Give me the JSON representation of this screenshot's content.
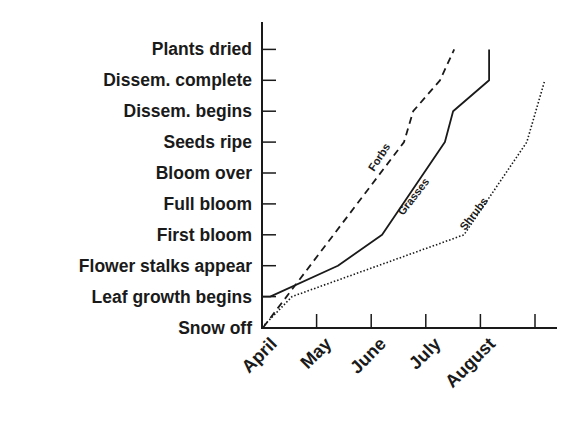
{
  "chart_data": {
    "type": "line",
    "title": "",
    "xlabel": "",
    "ylabel": "",
    "x_categories": [
      "April",
      "May",
      "June",
      "July",
      "August"
    ],
    "y_categories": [
      "Snow off",
      "Leaf growth begins",
      "Flower stalks appear",
      "First bloom",
      "Full bloom",
      "Bloom over",
      "Seeds ripe",
      "Dissem. begins",
      "Dissem. complete",
      "Plants dried"
    ],
    "x_unit": "months after April 1",
    "xlim": [
      0,
      5.4
    ],
    "ylim": [
      0,
      9
    ],
    "grid": false,
    "legend": "inline labels on lines",
    "series": [
      {
        "name": "Forbs",
        "style": "dashed",
        "points": [
          [
            0.02,
            0
          ],
          [
            2.6,
            6
          ],
          [
            2.77,
            7
          ],
          [
            3.26,
            8
          ],
          [
            3.52,
            9
          ]
        ]
      },
      {
        "name": "Grasses",
        "style": "solid",
        "points": [
          [
            0,
            0
          ],
          [
            0.0,
            1
          ],
          [
            0.15,
            1
          ],
          [
            1.39,
            2
          ],
          [
            2.2,
            3
          ],
          [
            3.35,
            6
          ],
          [
            3.5,
            7
          ],
          [
            4.16,
            8
          ],
          [
            4.16,
            9
          ]
        ]
      },
      {
        "name": "Shrubs",
        "style": "dotted",
        "points": [
          [
            0,
            0
          ],
          [
            0.55,
            1
          ],
          [
            3.7,
            3
          ],
          [
            4.85,
            6
          ],
          [
            5.18,
            8
          ]
        ]
      }
    ]
  }
}
